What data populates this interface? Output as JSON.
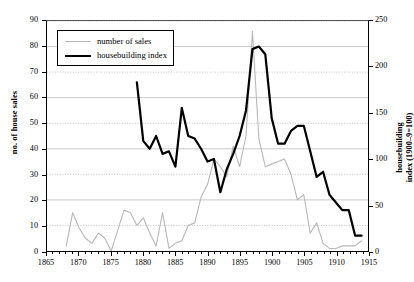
{
  "chart_data": {
    "type": "line",
    "title": "",
    "xlabel": "",
    "ylabel": "no. of house sales",
    "ylabel_right_line1": "housebuilding",
    "ylabel_right_line2": "index (1900–9=100)",
    "xlim": [
      1865,
      1915
    ],
    "ylim": [
      0,
      90
    ],
    "ylim_right": [
      0,
      250
    ],
    "xticks": [
      1865,
      1870,
      1875,
      1880,
      1885,
      1890,
      1895,
      1900,
      1905,
      1910,
      1915
    ],
    "yticks_left": [
      0,
      10,
      20,
      30,
      40,
      50,
      60,
      70,
      80,
      90
    ],
    "yticks_right": [
      0,
      50,
      100,
      150,
      200,
      250
    ],
    "grid": "horizontal",
    "legend_position": "upper-left",
    "series": [
      {
        "name": "number of sales",
        "axis": "left",
        "color": "#b8b8b8",
        "linewidth": 1.1,
        "x": [
          1868,
          1869,
          1870,
          1871,
          1872,
          1873,
          1874,
          1875,
          1876,
          1877,
          1878,
          1879,
          1880,
          1881,
          1882,
          1883,
          1884,
          1885,
          1886,
          1887,
          1888,
          1889,
          1890,
          1891,
          1892,
          1893,
          1894,
          1895,
          1896,
          1897,
          1898,
          1899,
          1900,
          1901,
          1902,
          1903,
          1904,
          1905,
          1906,
          1907,
          1908,
          1909,
          1910,
          1911,
          1912,
          1913,
          1914
        ],
        "values": [
          2,
          15,
          9,
          5,
          3,
          7,
          5,
          0,
          8,
          16,
          15,
          10,
          13,
          7,
          2,
          15,
          1,
          3,
          4,
          10,
          11,
          21,
          26,
          36,
          33,
          29,
          41,
          33,
          45,
          86,
          44,
          33,
          34,
          35,
          36,
          30,
          20,
          22,
          7,
          11,
          3,
          1,
          1,
          2,
          2,
          2,
          4
        ]
      },
      {
        "name": "housebuilding index",
        "axis": "right",
        "color": "#000000",
        "linewidth": 2.2,
        "x": [
          1879,
          1880,
          1881,
          1882,
          1883,
          1884,
          1885,
          1886,
          1887,
          1888,
          1889,
          1890,
          1891,
          1892,
          1893,
          1894,
          1895,
          1896,
          1897,
          1898,
          1899,
          1900,
          1901,
          1902,
          1903,
          1904,
          1905,
          1906,
          1907,
          1908,
          1909,
          1910,
          1911,
          1912,
          1913,
          1914
        ],
        "values_left_scale": [
          66,
          43,
          40,
          45,
          38,
          39,
          33,
          56,
          45,
          44,
          40,
          35,
          36,
          23,
          32,
          38,
          45,
          55,
          79,
          80,
          77,
          52,
          42,
          42,
          47,
          49,
          49,
          39,
          29,
          31,
          22,
          19,
          16,
          16,
          6,
          6
        ],
        "values": [
          183,
          119,
          111,
          125,
          106,
          108,
          92,
          156,
          125,
          122,
          111,
          97,
          100,
          64,
          89,
          106,
          125,
          153,
          219,
          222,
          214,
          144,
          117,
          117,
          131,
          136,
          136,
          108,
          81,
          86,
          61,
          53,
          44,
          44,
          17,
          17
        ]
      }
    ]
  },
  "legend": {
    "items": [
      {
        "label": "number of sales"
      },
      {
        "label": "housebuilding index"
      }
    ]
  }
}
